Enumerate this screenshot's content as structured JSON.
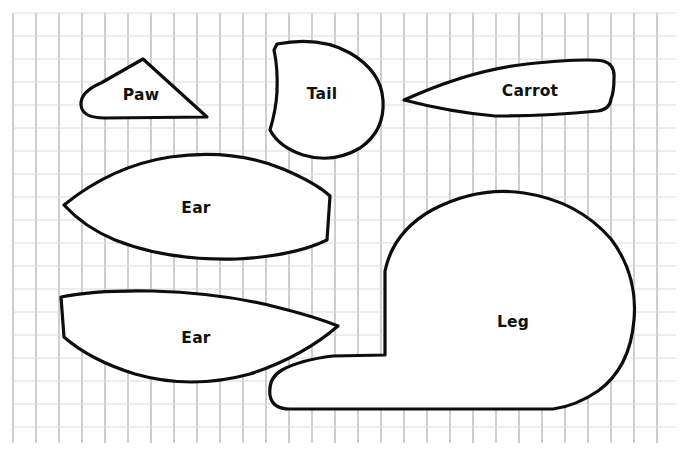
{
  "document": {
    "title": "Sewing Pattern Template Sheet",
    "background_color": "#ffffff",
    "outline_color": "#0d0d0d",
    "label_color": "#111111"
  },
  "grid": {
    "name": "graph-paper-grid",
    "line_color_minor": "#d8dade",
    "line_color_major": "#9a9da3",
    "cell_size_px": 23,
    "origin_x_px": 13,
    "origin_y_px": 13,
    "width_px": 663,
    "height_px": 430,
    "columns": 29,
    "rows": 19
  },
  "pieces": [
    {
      "id": "paw",
      "label": "Paw",
      "label_x": 141,
      "label_y": 95,
      "path": "M 143 59 L 207 117 L 105 118 Q 82 118 81 105 Q 80 92 101 83 Z"
    },
    {
      "id": "tail",
      "label": "Tail",
      "label_x": 322,
      "label_y": 94,
      "path": "M 277 44 Q 320 36 350 53 Q 381 71 383 100 Q 385 131 360 148 Q 333 164 303 155 Q 279 147 270 130 Q 276 110 277 92 Q 278 68 274 50 Z"
    },
    {
      "id": "carrot",
      "label": "Carrot",
      "label_x": 530,
      "label_y": 91,
      "path": "M 404 100 Q 470 70 527 64 Q 585 58 603 61 Q 615 64 614 78 Q 614 92 611 99 Q 610 109 598 111 Q 545 116 495 116 Q 450 112 404 100 Z"
    },
    {
      "id": "ear-top",
      "label": "Ear",
      "label_x": 196,
      "label_y": 208,
      "path": "M 64 205 Q 112 166 170 157 Q 232 148 283 169 Q 316 183 330 196 L 327 240 Q 294 256 237 259 Q 168 261 115 240 Q 84 227 64 205 Z"
    },
    {
      "id": "ear-bottom",
      "label": "Ear",
      "label_x": 196,
      "label_y": 338,
      "path": "M 338 326 Q 302 357 250 374 Q 191 390 135 374 Q 90 360 64 337 L 61 297 Q 95 290 152 291 Q 222 293 276 307 Q 313 316 338 326 Z"
    },
    {
      "id": "leg",
      "label": "Leg",
      "label_x": 513,
      "label_y": 322,
      "path": "M 385 355 L 385 271 Q 393 232 432 210 Q 478 186 524 193 Q 578 201 611 239 Q 638 275 634 320 Q 630 368 598 391 Q 576 406 553 409 L 290 409 Q 272 409 270 395 Q 268 378 282 370 Q 300 360 333 356 Z"
    }
  ]
}
